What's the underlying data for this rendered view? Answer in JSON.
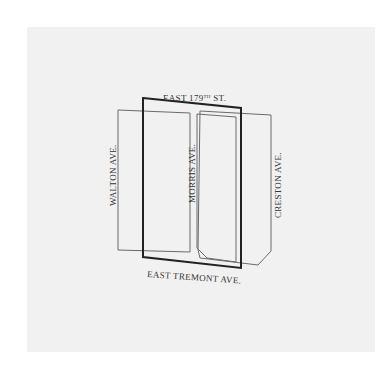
{
  "diagram": {
    "type": "street-block-map",
    "streets": {
      "north": "EAST 179",
      "north_suffix": "TH",
      "north_end": " ST.",
      "south": "EAST TREMONT AVE.",
      "west": "WALTON AVE.",
      "middle": "MORRIS AVE.",
      "east": "CRESTON AVE."
    },
    "colors": {
      "paper": "#f1f1f1",
      "background": "#ffffff",
      "thin_line": "#6a6a6a",
      "thick_line": "#222222",
      "text": "#333333"
    }
  }
}
